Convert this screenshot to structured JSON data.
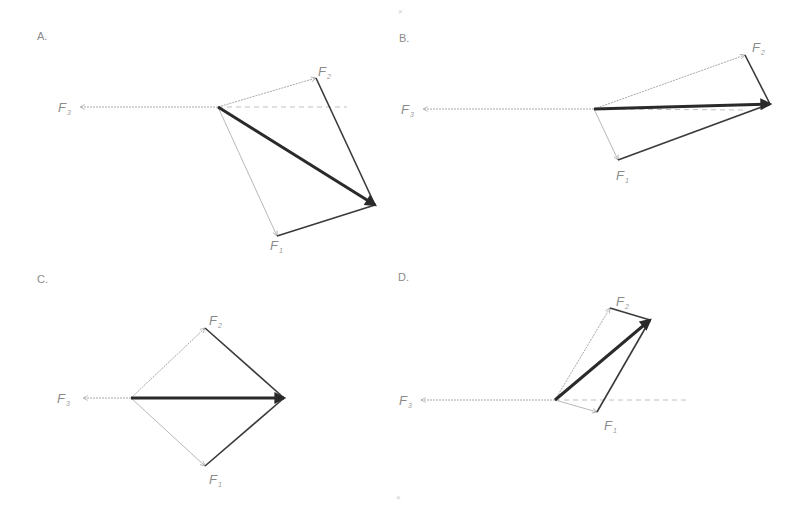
{
  "figure": {
    "type": "force vector parallelogram diagrams (multiple choice)",
    "top_mark": "×",
    "bottom_mark": "×"
  },
  "panels": [
    {
      "label": "A.",
      "origin": [
        218,
        107
      ],
      "f3": {
        "label": "F",
        "sub": "3",
        "tip": [
          80,
          107
        ],
        "label_pos": [
          58,
          112
        ]
      },
      "f2": {
        "label": "F",
        "sub": "2",
        "tip": [
          316,
          78
        ],
        "label_pos": [
          318,
          76
        ]
      },
      "f1": {
        "label": "F",
        "sub": "1",
        "tip": [
          277,
          236
        ],
        "label_pos": [
          270,
          250
        ]
      },
      "resultant_tip": [
        375,
        205
      ],
      "dashed_end": [
        347,
        107
      ]
    },
    {
      "label": "B.",
      "origin": [
        594,
        109
      ],
      "f3": {
        "label": "F",
        "sub": "3",
        "tip": [
          423,
          109
        ],
        "label_pos": [
          401,
          114
        ]
      },
      "f2": {
        "label": "F",
        "sub": "2",
        "tip": [
          745,
          55
        ],
        "label_pos": [
          752,
          52
        ]
      },
      "f1": {
        "label": "F",
        "sub": "1",
        "tip": [
          618,
          160
        ],
        "label_pos": [
          616,
          180
        ]
      },
      "resultant_tip": [
        770,
        104
      ],
      "dashed_end": [
        745,
        110
      ]
    },
    {
      "label": "C.",
      "origin": [
        131,
        398
      ],
      "f3": {
        "label": "F",
        "sub": "3",
        "tip": [
          83,
          398
        ],
        "label_pos": [
          57,
          403
        ]
      },
      "f2": {
        "label": "F",
        "sub": "2",
        "tip": [
          205,
          328
        ],
        "label_pos": [
          209,
          325
        ]
      },
      "f1": {
        "label": "F",
        "sub": "1",
        "tip": [
          205,
          466
        ],
        "label_pos": [
          209,
          484
        ]
      },
      "resultant_tip": [
        284,
        398
      ],
      "dashed_end": null
    },
    {
      "label": "D.",
      "origin": [
        555,
        400
      ],
      "f3": {
        "label": "F",
        "sub": "3",
        "tip": [
          421,
          400
        ],
        "label_pos": [
          399,
          405
        ]
      },
      "f2": {
        "label": "F",
        "sub": "2",
        "tip": [
          610,
          308
        ],
        "label_pos": [
          616,
          306
        ]
      },
      "f1": {
        "label": "F",
        "sub": "1",
        "tip": [
          597,
          412
        ],
        "label_pos": [
          604,
          430
        ]
      },
      "resultant_tip": [
        650,
        320
      ],
      "dashed_end": [
        686,
        400
      ]
    }
  ],
  "colors": {
    "thin": "#b8b8b8",
    "side": "#3a3a3a",
    "resultant": "#2a2a2a",
    "label": "#8a8a8a"
  }
}
